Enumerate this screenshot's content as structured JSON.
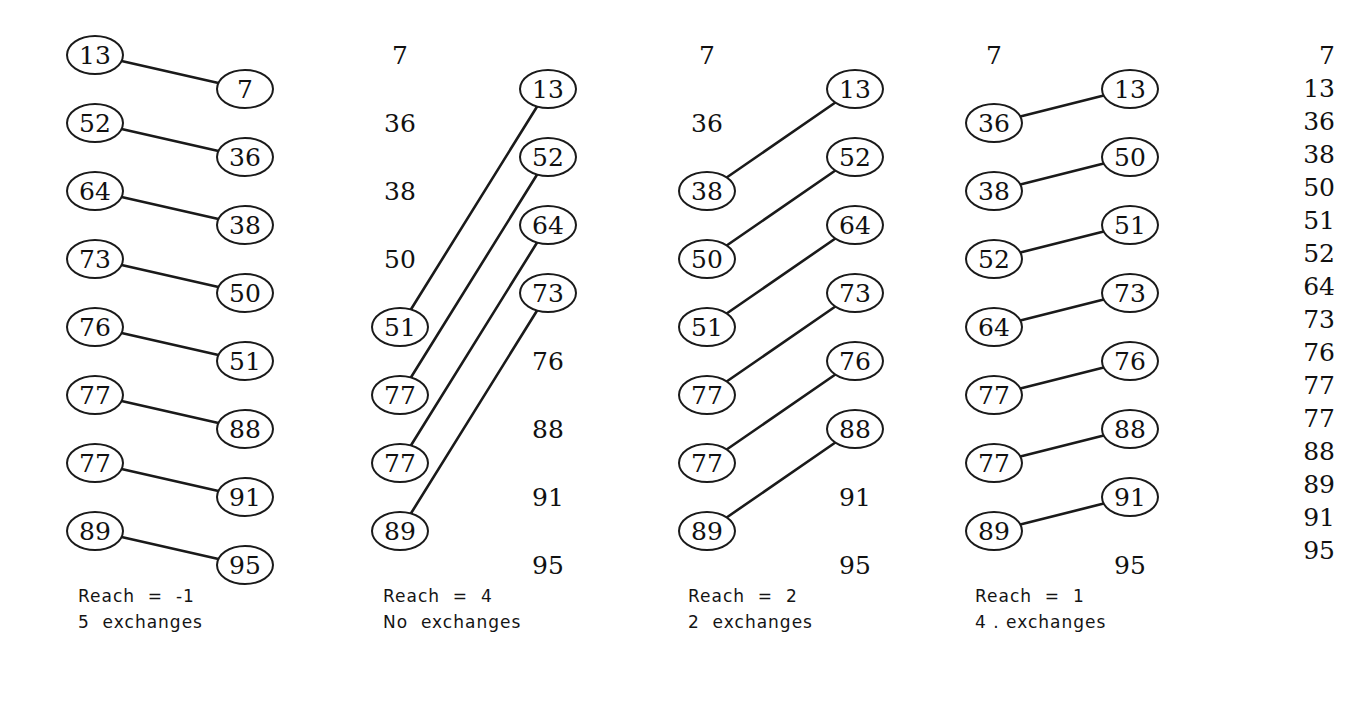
{
  "figure": {
    "background_color": "#ffffff",
    "ink_color": "#1a1a1a",
    "row_count": 16,
    "row_spacing_px": 34,
    "first_row_y_px": 55,
    "node_shape": "ellipse"
  },
  "passes": [
    {
      "index": 0,
      "caption_line1": "Reach  =  -1",
      "caption_line2": "5  exchanges",
      "caption_x": 78,
      "caption_y": 583,
      "left_x": 95,
      "right_x": 245,
      "items": [
        {
          "row": 0,
          "value": "13",
          "side": "left",
          "circled": true
        },
        {
          "row": 1,
          "value": "7",
          "side": "right",
          "circled": true
        },
        {
          "row": 2,
          "value": "52",
          "side": "left",
          "circled": true
        },
        {
          "row": 3,
          "value": "36",
          "side": "right",
          "circled": true
        },
        {
          "row": 4,
          "value": "64",
          "side": "left",
          "circled": true
        },
        {
          "row": 5,
          "value": "38",
          "side": "right",
          "circled": true
        },
        {
          "row": 6,
          "value": "73",
          "side": "left",
          "circled": true
        },
        {
          "row": 7,
          "value": "50",
          "side": "right",
          "circled": true
        },
        {
          "row": 8,
          "value": "76",
          "side": "left",
          "circled": true
        },
        {
          "row": 9,
          "value": "51",
          "side": "right",
          "circled": true
        },
        {
          "row": 10,
          "value": "77",
          "side": "left",
          "circled": true
        },
        {
          "row": 11,
          "value": "88",
          "side": "right",
          "circled": true
        },
        {
          "row": 12,
          "value": "77",
          "side": "left",
          "circled": true
        },
        {
          "row": 13,
          "value": "91",
          "side": "right",
          "circled": true
        },
        {
          "row": 14,
          "value": "89",
          "side": "left",
          "circled": true
        },
        {
          "row": 15,
          "value": "95",
          "side": "right",
          "circled": true
        }
      ],
      "links": [
        {
          "from_row": 0,
          "to_row": 1
        },
        {
          "from_row": 2,
          "to_row": 3
        },
        {
          "from_row": 4,
          "to_row": 5
        },
        {
          "from_row": 6,
          "to_row": 7
        },
        {
          "from_row": 8,
          "to_row": 9
        },
        {
          "from_row": 10,
          "to_row": 11
        },
        {
          "from_row": 12,
          "to_row": 13
        },
        {
          "from_row": 14,
          "to_row": 15
        }
      ]
    },
    {
      "index": 1,
      "caption_line1": "Reach  =  4",
      "caption_line2": "No  exchanges",
      "caption_x": 383,
      "caption_y": 583,
      "left_x": 400,
      "right_x": 548,
      "items": [
        {
          "row": 0,
          "value": "7",
          "side": "left",
          "circled": false
        },
        {
          "row": 1,
          "value": "13",
          "side": "right",
          "circled": true
        },
        {
          "row": 2,
          "value": "36",
          "side": "left",
          "circled": false
        },
        {
          "row": 3,
          "value": "52",
          "side": "right",
          "circled": true
        },
        {
          "row": 4,
          "value": "38",
          "side": "left",
          "circled": false
        },
        {
          "row": 5,
          "value": "64",
          "side": "right",
          "circled": true
        },
        {
          "row": 6,
          "value": "50",
          "side": "left",
          "circled": false
        },
        {
          "row": 7,
          "value": "73",
          "side": "right",
          "circled": true
        },
        {
          "row": 8,
          "value": "51",
          "side": "left",
          "circled": true
        },
        {
          "row": 9,
          "value": "76",
          "side": "right",
          "circled": false
        },
        {
          "row": 10,
          "value": "77",
          "side": "left",
          "circled": true
        },
        {
          "row": 11,
          "value": "88",
          "side": "right",
          "circled": false
        },
        {
          "row": 12,
          "value": "77",
          "side": "left",
          "circled": true
        },
        {
          "row": 13,
          "value": "91",
          "side": "right",
          "circled": false
        },
        {
          "row": 14,
          "value": "89",
          "side": "left",
          "circled": true
        },
        {
          "row": 15,
          "value": "95",
          "side": "right",
          "circled": false
        }
      ],
      "links": [
        {
          "from_row": 8,
          "to_row": 1
        },
        {
          "from_row": 10,
          "to_row": 3
        },
        {
          "from_row": 12,
          "to_row": 5
        },
        {
          "from_row": 14,
          "to_row": 7
        }
      ]
    },
    {
      "index": 2,
      "caption_line1": "Reach  =  2",
      "caption_line2": "2  exchanges",
      "caption_x": 688,
      "caption_y": 583,
      "left_x": 707,
      "right_x": 855,
      "items": [
        {
          "row": 0,
          "value": "7",
          "side": "left",
          "circled": false
        },
        {
          "row": 1,
          "value": "13",
          "side": "right",
          "circled": true
        },
        {
          "row": 2,
          "value": "36",
          "side": "left",
          "circled": false
        },
        {
          "row": 3,
          "value": "52",
          "side": "right",
          "circled": true
        },
        {
          "row": 4,
          "value": "38",
          "side": "left",
          "circled": true
        },
        {
          "row": 5,
          "value": "64",
          "side": "right",
          "circled": true
        },
        {
          "row": 6,
          "value": "50",
          "side": "left",
          "circled": true
        },
        {
          "row": 7,
          "value": "73",
          "side": "right",
          "circled": true
        },
        {
          "row": 8,
          "value": "51",
          "side": "left",
          "circled": true
        },
        {
          "row": 9,
          "value": "76",
          "side": "right",
          "circled": true
        },
        {
          "row": 10,
          "value": "77",
          "side": "left",
          "circled": true
        },
        {
          "row": 11,
          "value": "88",
          "side": "right",
          "circled": true
        },
        {
          "row": 12,
          "value": "77",
          "side": "left",
          "circled": true
        },
        {
          "row": 13,
          "value": "91",
          "side": "right",
          "circled": false
        },
        {
          "row": 14,
          "value": "89",
          "side": "left",
          "circled": true
        },
        {
          "row": 15,
          "value": "95",
          "side": "right",
          "circled": false
        }
      ],
      "links": [
        {
          "from_row": 4,
          "to_row": 1
        },
        {
          "from_row": 6,
          "to_row": 3
        },
        {
          "from_row": 8,
          "to_row": 5
        },
        {
          "from_row": 10,
          "to_row": 7
        },
        {
          "from_row": 12,
          "to_row": 9
        },
        {
          "from_row": 14,
          "to_row": 11
        }
      ]
    },
    {
      "index": 3,
      "caption_line1": "Reach  =  1",
      "caption_line2": "4 . exchanges",
      "caption_x": 975,
      "caption_y": 583,
      "left_x": 994,
      "right_x": 1130,
      "items": [
        {
          "row": 0,
          "value": "7",
          "side": "left",
          "circled": false
        },
        {
          "row": 1,
          "value": "13",
          "side": "right",
          "circled": true
        },
        {
          "row": 2,
          "value": "36",
          "side": "left",
          "circled": true
        },
        {
          "row": 3,
          "value": "50",
          "side": "right",
          "circled": true
        },
        {
          "row": 4,
          "value": "38",
          "side": "left",
          "circled": true
        },
        {
          "row": 5,
          "value": "51",
          "side": "right",
          "circled": true
        },
        {
          "row": 6,
          "value": "52",
          "side": "left",
          "circled": true
        },
        {
          "row": 7,
          "value": "73",
          "side": "right",
          "circled": true
        },
        {
          "row": 8,
          "value": "64",
          "side": "left",
          "circled": true
        },
        {
          "row": 9,
          "value": "76",
          "side": "right",
          "circled": true
        },
        {
          "row": 10,
          "value": "77",
          "side": "left",
          "circled": true
        },
        {
          "row": 11,
          "value": "88",
          "side": "right",
          "circled": true
        },
        {
          "row": 12,
          "value": "77",
          "side": "left",
          "circled": true
        },
        {
          "row": 13,
          "value": "91",
          "side": "right",
          "circled": true
        },
        {
          "row": 14,
          "value": "89",
          "side": "left",
          "circled": true
        },
        {
          "row": 15,
          "value": "95",
          "side": "right",
          "circled": false
        }
      ],
      "links": [
        {
          "from_row": 2,
          "to_row": 1
        },
        {
          "from_row": 4,
          "to_row": 3
        },
        {
          "from_row": 6,
          "to_row": 5
        },
        {
          "from_row": 8,
          "to_row": 7
        },
        {
          "from_row": 10,
          "to_row": 9
        },
        {
          "from_row": 12,
          "to_row": 11
        },
        {
          "from_row": 14,
          "to_row": 13
        }
      ]
    }
  ],
  "final_column": {
    "x": 1285,
    "first_y": 55,
    "spacing": 33,
    "values": [
      "7",
      "13",
      "36",
      "38",
      "50",
      "51",
      "52",
      "64",
      "73",
      "76",
      "77",
      "77",
      "88",
      "89",
      "91",
      "95"
    ]
  },
  "chart_data": {
    "type": "diagram",
    "series": [
      {
        "name": "Pass 1 (Reach = -1)",
        "values": [
          "13",
          "7",
          "52",
          "36",
          "64",
          "38",
          "73",
          "50",
          "76",
          "51",
          "77",
          "88",
          "77",
          "91",
          "89",
          "95"
        ]
      },
      {
        "name": "Pass 2 (Reach = 4)",
        "values": [
          "7",
          "13",
          "36",
          "52",
          "38",
          "64",
          "50",
          "73",
          "51",
          "76",
          "77",
          "88",
          "77",
          "91",
          "89",
          "95"
        ]
      },
      {
        "name": "Pass 3 (Reach = 2)",
        "values": [
          "7",
          "13",
          "36",
          "52",
          "38",
          "64",
          "50",
          "73",
          "51",
          "76",
          "77",
          "88",
          "77",
          "91",
          "89",
          "95"
        ]
      },
      {
        "name": "Pass 4 (Reach = 1)",
        "values": [
          "7",
          "13",
          "36",
          "50",
          "38",
          "51",
          "52",
          "73",
          "64",
          "76",
          "77",
          "88",
          "77",
          "91",
          "89",
          "95"
        ]
      },
      {
        "name": "Final sorted",
        "values": [
          "7",
          "13",
          "36",
          "38",
          "50",
          "51",
          "52",
          "64",
          "73",
          "76",
          "77",
          "77",
          "88",
          "89",
          "91",
          "95"
        ]
      }
    ],
    "annotations": [
      "Reach  =  -1 / 5  exchanges",
      "Reach  =  4 / No  exchanges",
      "Reach  =  2 / 2  exchanges",
      "Reach  =  1 / 4 . exchanges"
    ]
  }
}
